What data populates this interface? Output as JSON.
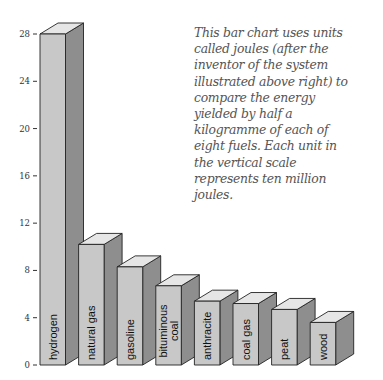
{
  "caption": {
    "lines": [
      "This bar chart uses units",
      "called joules (after the",
      "inventor of the system",
      "illustrated above right) to",
      "compare the energy",
      "yielded by half a",
      "kilogramme of each of",
      "eight fuels. Each unit in",
      "the vertical scale",
      "represents ten million",
      "joules."
    ]
  },
  "colors": {
    "front": "#c8c8c8",
    "side": "#8e8e8e",
    "top": "#e6e6e6",
    "outline": "#222222"
  },
  "chart_data": {
    "type": "bar",
    "title": "",
    "xlabel": "",
    "ylabel": "",
    "ylim": [
      0,
      28
    ],
    "yticks": [
      0,
      4,
      8,
      12,
      16,
      20,
      24,
      28
    ],
    "grid": false,
    "legend": "none",
    "style": "3d-columns",
    "categories": [
      "hydrogen",
      "natural gas",
      "gasoline",
      "bituminous coal",
      "anthracite",
      "coal gas",
      "peat",
      "wood"
    ],
    "category_label_lines": [
      [
        "hydrogen"
      ],
      [
        "natural gas"
      ],
      [
        "gasoline"
      ],
      [
        "bituminous",
        "coal"
      ],
      [
        "anthracite"
      ],
      [
        "coal gas"
      ],
      [
        "peat"
      ],
      [
        "wood"
      ]
    ],
    "values": [
      28,
      10.2,
      8.3,
      6.7,
      5.4,
      5.2,
      4.7,
      3.6
    ],
    "units": "x 10 million joules per half kilogramme"
  }
}
